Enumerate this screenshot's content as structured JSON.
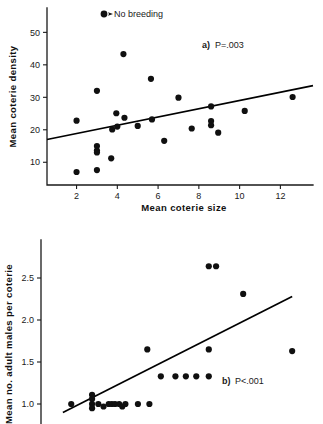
{
  "figure": {
    "background_color": "#ffffff",
    "marker_color": "#101010",
    "line_color": "#000000",
    "axis_color": "#1a1a1a"
  },
  "legend": {
    "marker_name": "filled-circle-marker",
    "label": "No breeding"
  },
  "chart_data": [
    {
      "type": "scatter",
      "panel": "a",
      "title": "",
      "annotation": "P=.003",
      "panel_letter": "a)",
      "xlabel": "Mean coterie size",
      "ylabel": "Mean coterie density",
      "xlim": [
        0.55,
        13.6
      ],
      "ylim": [
        3.0,
        57.5
      ],
      "xticks": [
        2,
        4,
        6,
        8,
        10,
        12
      ],
      "yticks": [
        10,
        20,
        30,
        40,
        50
      ],
      "grid": false,
      "legend_position": "top-center",
      "fit_line": {
        "x": [
          0.55,
          13.6
        ],
        "y": [
          17.0,
          33.6
        ]
      },
      "points": [
        {
          "x": 2.0,
          "y": 22.8
        },
        {
          "x": 2.0,
          "y": 7.0
        },
        {
          "x": 3.0,
          "y": 32.0
        },
        {
          "x": 3.0,
          "y": 15.0
        },
        {
          "x": 3.0,
          "y": 13.6
        },
        {
          "x": 3.0,
          "y": 13.0
        },
        {
          "x": 3.0,
          "y": 7.6
        },
        {
          "x": 3.7,
          "y": 11.2
        },
        {
          "x": 3.75,
          "y": 20.1
        },
        {
          "x": 3.95,
          "y": 25.1
        },
        {
          "x": 4.0,
          "y": 21.0
        },
        {
          "x": 4.3,
          "y": 43.3
        },
        {
          "x": 4.35,
          "y": 23.7
        },
        {
          "x": 5.0,
          "y": 21.2
        },
        {
          "x": 5.65,
          "y": 35.7
        },
        {
          "x": 5.7,
          "y": 23.2
        },
        {
          "x": 6.3,
          "y": 16.6
        },
        {
          "x": 7.0,
          "y": 29.9
        },
        {
          "x": 7.65,
          "y": 20.4
        },
        {
          "x": 8.6,
          "y": 27.2
        },
        {
          "x": 8.6,
          "y": 22.7
        },
        {
          "x": 8.6,
          "y": 21.4
        },
        {
          "x": 8.95,
          "y": 19.1
        },
        {
          "x": 10.25,
          "y": 25.8
        },
        {
          "x": 12.6,
          "y": 30.1
        }
      ]
    },
    {
      "type": "scatter",
      "panel": "b",
      "title": "",
      "annotation": "P<.001",
      "panel_letter": "b)",
      "xlabel": "",
      "ylabel": "Mean no. adult males per coterie",
      "xlim": [
        0.55,
        13.6
      ],
      "ylim": [
        0.88,
        2.82
      ],
      "xticks": [],
      "yticks": [
        1.0,
        1.5,
        2.0,
        2.5
      ],
      "grid": false,
      "legend_position": "none",
      "fit_line": {
        "x": [
          1.6,
          12.6
        ],
        "y": [
          0.9,
          2.28
        ]
      },
      "points": [
        {
          "x": 2.0,
          "y": 1.0
        },
        {
          "x": 3.0,
          "y": 1.11
        },
        {
          "x": 3.0,
          "y": 1.06
        },
        {
          "x": 3.0,
          "y": 1.0
        },
        {
          "x": 3.0,
          "y": 0.95
        },
        {
          "x": 3.3,
          "y": 1.0
        },
        {
          "x": 3.55,
          "y": 0.97
        },
        {
          "x": 3.8,
          "y": 1.0
        },
        {
          "x": 3.95,
          "y": 1.0
        },
        {
          "x": 4.1,
          "y": 1.0
        },
        {
          "x": 4.3,
          "y": 1.0
        },
        {
          "x": 4.45,
          "y": 0.97
        },
        {
          "x": 4.6,
          "y": 1.0
        },
        {
          "x": 5.2,
          "y": 1.0
        },
        {
          "x": 5.75,
          "y": 1.0
        },
        {
          "x": 5.65,
          "y": 1.65
        },
        {
          "x": 6.3,
          "y": 1.33
        },
        {
          "x": 7.0,
          "y": 1.33
        },
        {
          "x": 7.5,
          "y": 1.33
        },
        {
          "x": 8.0,
          "y": 1.33
        },
        {
          "x": 8.6,
          "y": 1.33
        },
        {
          "x": 8.6,
          "y": 1.65
        },
        {
          "x": 8.6,
          "y": 2.64
        },
        {
          "x": 8.95,
          "y": 2.64
        },
        {
          "x": 10.25,
          "y": 2.31
        },
        {
          "x": 12.6,
          "y": 1.63
        }
      ]
    }
  ]
}
